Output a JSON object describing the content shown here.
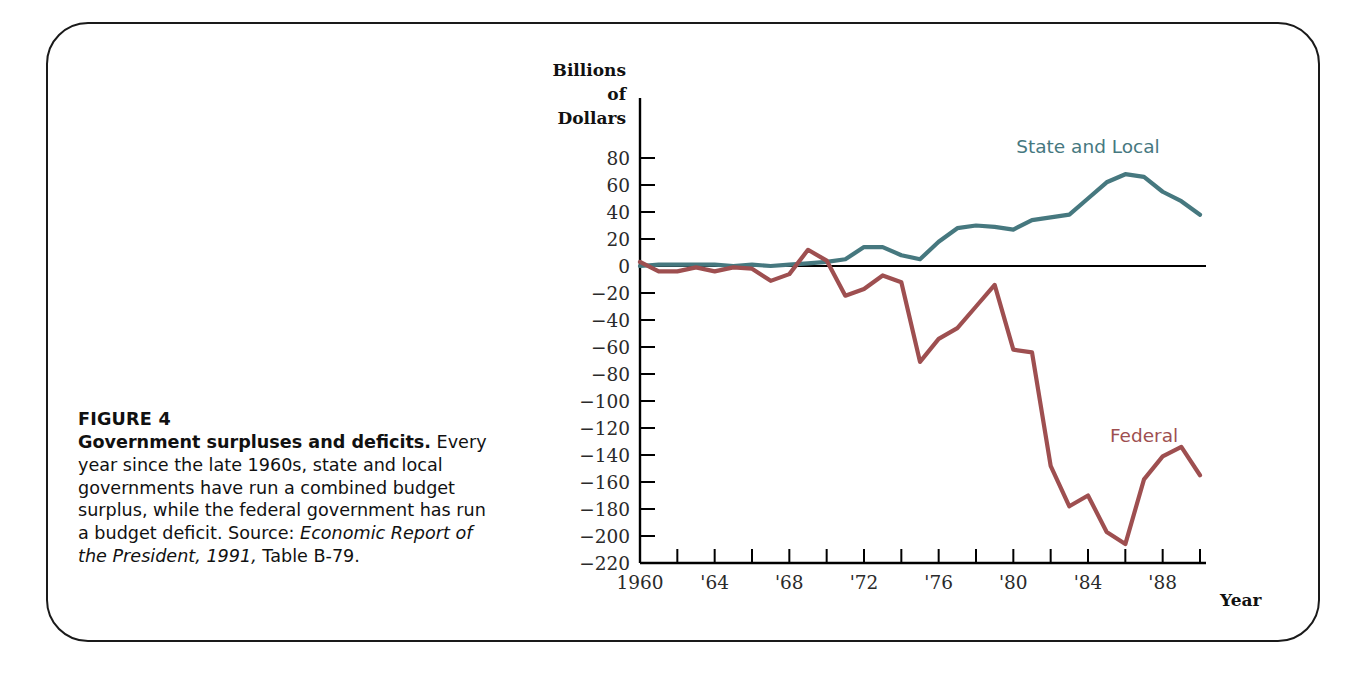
{
  "figure": {
    "number_label": "FIGURE 4",
    "title": "Government surpluses and deficits.",
    "caption_body": "Every year since the late 1960s, state and local governments have run a combined budget surplus, while the federal government has run a budget deficit.",
    "source_prefix": "Source: ",
    "source_italic": "Economic Report of the President, 1991,",
    "source_suffix": " Table B-79."
  },
  "chart_data": {
    "type": "line",
    "title": "Government surpluses and deficits.",
    "xlabel": "Year",
    "ylabel": "Billions of Dollars",
    "ylabel_lines": [
      "Billions",
      "of",
      "Dollars"
    ],
    "xlim": [
      1960,
      1990
    ],
    "ylim": [
      -220,
      80
    ],
    "grid": false,
    "legend_position": "inline-at-series",
    "ytick_values": [
      80,
      60,
      40,
      20,
      0,
      -20,
      -40,
      -60,
      -80,
      -100,
      -120,
      -140,
      -160,
      -180,
      -200,
      -220
    ],
    "ytick_labels": [
      "80",
      "60",
      "40",
      "20",
      "0",
      "−20",
      "−40",
      "−60",
      "−80",
      "−100",
      "−120",
      "−140",
      "−160",
      "−180",
      "−200",
      "−220"
    ],
    "xtick_values": [
      1960,
      1962,
      1964,
      1966,
      1968,
      1970,
      1972,
      1974,
      1976,
      1978,
      1980,
      1982,
      1984,
      1986,
      1988,
      1990
    ],
    "xtick_labels": [
      "1960",
      "",
      "'64",
      "",
      "'68",
      "",
      "'72",
      "",
      "'76",
      "",
      "'80",
      "",
      "'84",
      "",
      "'88",
      ""
    ],
    "zero_line": 0,
    "x": [
      1960,
      1961,
      1962,
      1963,
      1964,
      1965,
      1966,
      1967,
      1968,
      1969,
      1970,
      1971,
      1972,
      1973,
      1974,
      1975,
      1976,
      1977,
      1978,
      1979,
      1980,
      1981,
      1982,
      1983,
      1984,
      1985,
      1986,
      1987,
      1988,
      1989,
      1990
    ],
    "series": [
      {
        "name": "State and Local",
        "color": "#46787f",
        "label_x": 1984,
        "label_y": 84,
        "values": [
          0,
          1,
          1,
          1,
          1,
          0,
          1,
          0,
          1,
          2,
          3,
          5,
          14,
          14,
          8,
          5,
          18,
          28,
          30,
          29,
          27,
          34,
          36,
          38,
          50,
          62,
          68,
          66,
          55,
          48,
          38
        ]
      },
      {
        "name": "Federal",
        "color": "#9e4f50",
        "label_x": 1987,
        "label_y": -130,
        "values": [
          3,
          -4,
          -4,
          -1,
          -4,
          -1,
          -2,
          -11,
          -6,
          12,
          4,
          -22,
          -17,
          -7,
          -12,
          -71,
          -54,
          -46,
          -30,
          -14,
          -62,
          -64,
          -148,
          -178,
          -170,
          -197,
          -206,
          -158,
          -141,
          -134,
          -155
        ]
      }
    ]
  }
}
